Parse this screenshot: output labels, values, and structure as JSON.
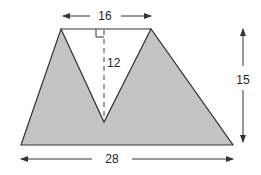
{
  "diagram": {
    "type": "geometry",
    "labels": {
      "top_width": "16",
      "notch_height": "12",
      "total_height": "15",
      "bottom_width": "28"
    },
    "colors": {
      "fill": "#c4c4c4",
      "stroke": "#333333"
    }
  }
}
